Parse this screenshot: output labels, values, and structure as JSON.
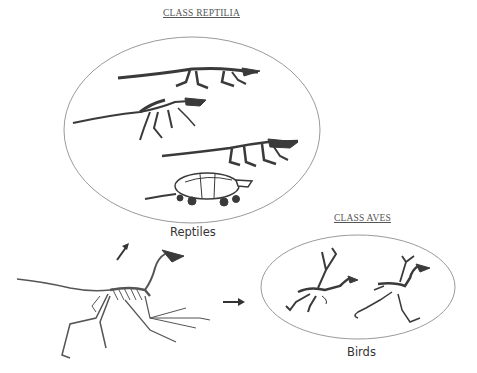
{
  "diagram": {
    "reptilia": {
      "class_title": "CLASS REPTILIA",
      "group_label": "Reptiles",
      "members": [
        "crocodilian-skeleton",
        "early-archosaur-skeleton",
        "lizard-skeleton",
        "turtle-skeleton"
      ]
    },
    "aves": {
      "class_title": "CLASS AVES",
      "group_label": "Birds",
      "members": [
        "bird-skeleton-1",
        "bird-skeleton-2"
      ]
    },
    "ancestor": {
      "name": "ancestral-dinosaur-skeleton"
    },
    "arrows": [
      {
        "from": "ancestor",
        "to": "reptilia",
        "direction": "up-right"
      },
      {
        "from": "ancestor",
        "to": "aves",
        "direction": "right"
      }
    ],
    "colors": {
      "ellipse_stroke": "#9a9a9a",
      "skeleton": "#3a3a3a",
      "arrow": "#333333",
      "text": "#444444"
    }
  }
}
